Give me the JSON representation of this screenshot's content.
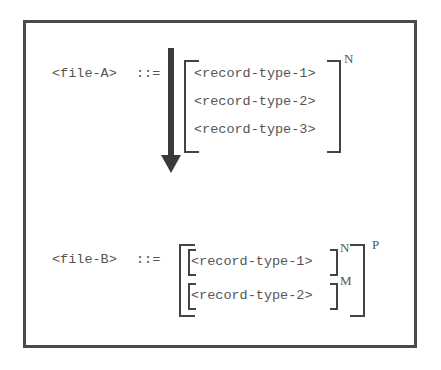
{
  "diagram": {
    "type": "grammar-transformation",
    "file_a": {
      "lhs": "<file-A>",
      "operator": "::=",
      "items": [
        "<record-type-1>",
        "<record-type-2>",
        "<record-type-3>"
      ],
      "repeat": "N"
    },
    "arrow": {
      "direction": "down",
      "label": ""
    },
    "file_b": {
      "lhs": "<file-B>",
      "operator": "::=",
      "groups": [
        {
          "item": "<record-type-1>",
          "repeat": "N"
        },
        {
          "item": "<record-type-2>",
          "repeat": "M"
        }
      ],
      "outer_repeat": "P"
    }
  }
}
